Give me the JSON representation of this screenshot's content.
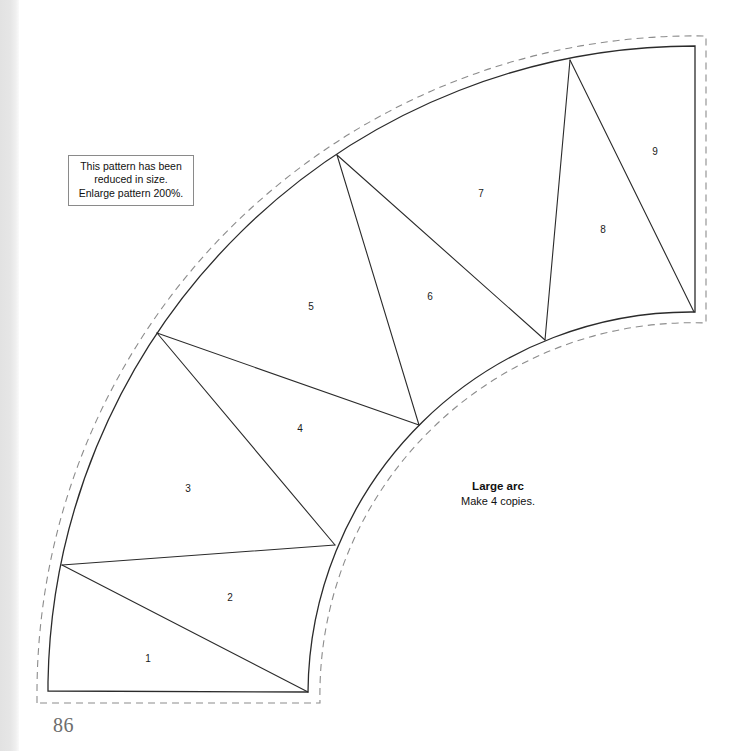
{
  "page": {
    "folio": "86",
    "background_color": "#ffffff",
    "ink_color": "#2b2b2b",
    "dashed_color": "#8c8c8c",
    "binding_shadow_color": "#e2e2e2"
  },
  "note_box": {
    "name": "reduction-notice",
    "lines": [
      "This pattern has been",
      "reduced in size.",
      "Enlarge pattern 200%."
    ],
    "border_color": "#8a8a8a"
  },
  "arc_caption": {
    "title": "Large arc",
    "subtitle": "Make 4 copies."
  },
  "pattern": {
    "shape": "quarter annulus sector",
    "arc_center": {
      "x": 695,
      "y": 692
    },
    "outer_radius": 647,
    "inner_radius": 383,
    "seam_allowance_px": 11,
    "solid_line_width": 1.2,
    "dashed_line_width": 1.1,
    "dash_pattern": "7 5",
    "outer_arc_points": [
      {
        "x": 48,
        "y": 691
      },
      {
        "x": 62,
        "y": 565
      },
      {
        "x": 157,
        "y": 333
      },
      {
        "x": 337,
        "y": 155
      },
      {
        "x": 570,
        "y": 60
      },
      {
        "x": 695,
        "y": 46
      }
    ],
    "inner_arc_points": [
      {
        "x": 308,
        "y": 692
      },
      {
        "x": 335,
        "y": 545
      },
      {
        "x": 419,
        "y": 425
      },
      {
        "x": 545,
        "y": 340
      },
      {
        "x": 694,
        "y": 312
      }
    ],
    "seam_lines": [
      {
        "from": {
          "x": 62,
          "y": 565
        },
        "to": {
          "x": 335,
          "y": 545
        }
      },
      {
        "from": {
          "x": 62,
          "y": 565
        },
        "to": {
          "x": 308,
          "y": 692
        }
      },
      {
        "from": {
          "x": 157,
          "y": 333
        },
        "to": {
          "x": 335,
          "y": 545
        }
      },
      {
        "from": {
          "x": 157,
          "y": 333
        },
        "to": {
          "x": 419,
          "y": 425
        }
      },
      {
        "from": {
          "x": 337,
          "y": 155
        },
        "to": {
          "x": 419,
          "y": 425
        }
      },
      {
        "from": {
          "x": 337,
          "y": 155
        },
        "to": {
          "x": 545,
          "y": 340
        }
      },
      {
        "from": {
          "x": 570,
          "y": 60
        },
        "to": {
          "x": 545,
          "y": 340
        }
      },
      {
        "from": {
          "x": 570,
          "y": 60
        },
        "to": {
          "x": 694,
          "y": 312
        }
      }
    ],
    "pieces": [
      {
        "label": "1",
        "x": 148,
        "y": 658
      },
      {
        "label": "2",
        "x": 230,
        "y": 597
      },
      {
        "label": "3",
        "x": 188,
        "y": 488
      },
      {
        "label": "4",
        "x": 300,
        "y": 428
      },
      {
        "label": "5",
        "x": 311,
        "y": 306
      },
      {
        "label": "6",
        "x": 430,
        "y": 296
      },
      {
        "label": "7",
        "x": 481,
        "y": 193
      },
      {
        "label": "8",
        "x": 603,
        "y": 229
      },
      {
        "label": "9",
        "x": 655,
        "y": 151
      }
    ]
  }
}
